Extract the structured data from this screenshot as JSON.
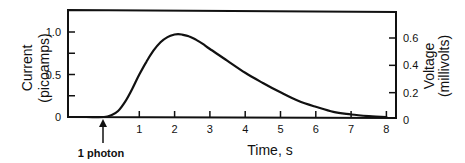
{
  "chart_data": {
    "type": "line",
    "title": "",
    "xlabel": "Time, s",
    "ylabel": "Current (picoamps)",
    "ylabel_lines": [
      "Current",
      "(picoamps)"
    ],
    "y2label": "Voltage (millivolts)",
    "y2label_lines": [
      "Voltage",
      "(millivolts)"
    ],
    "xlim": [
      -1.0,
      8.3
    ],
    "ylim": [
      0,
      1.25
    ],
    "y2lim": [
      0,
      0.74
    ],
    "grid": false,
    "legend": null,
    "x_ticks": [
      1,
      2,
      3,
      4,
      5,
      6,
      7,
      8
    ],
    "x_tick_labels": [
      "1",
      "2",
      "3",
      "4",
      "5",
      "6",
      "7",
      "8"
    ],
    "y_ticks": [
      0,
      0.25,
      0.5,
      0.75,
      1.0
    ],
    "y_tick_labels": [
      "0",
      "",
      "0.5",
      "",
      "1.0"
    ],
    "y2_ticks": [
      0,
      0.2,
      0.4,
      0.6
    ],
    "y2_tick_labels": [
      "0",
      "0.2",
      "0.4",
      "0.6"
    ],
    "annotations": [
      {
        "text": "1 photon",
        "x": 0,
        "type": "arrow-up",
        "note": "stimulus onset"
      }
    ],
    "series": [
      {
        "name": "Single-photon response",
        "x": [
          -1.0,
          -0.5,
          0.0,
          0.2,
          0.4,
          0.6,
          0.8,
          1.0,
          1.2,
          1.4,
          1.6,
          1.8,
          2.0,
          2.1,
          2.2,
          2.4,
          2.6,
          2.8,
          3.0,
          3.5,
          4.0,
          4.5,
          5.0,
          5.5,
          6.0,
          6.5,
          7.0,
          7.5,
          8.0
        ],
        "values": [
          0.0,
          0.0,
          0.0,
          0.02,
          0.07,
          0.18,
          0.33,
          0.5,
          0.65,
          0.78,
          0.88,
          0.94,
          0.97,
          0.975,
          0.97,
          0.95,
          0.91,
          0.86,
          0.8,
          0.66,
          0.52,
          0.4,
          0.29,
          0.19,
          0.12,
          0.06,
          0.03,
          0.01,
          0.0
        ]
      }
    ]
  }
}
